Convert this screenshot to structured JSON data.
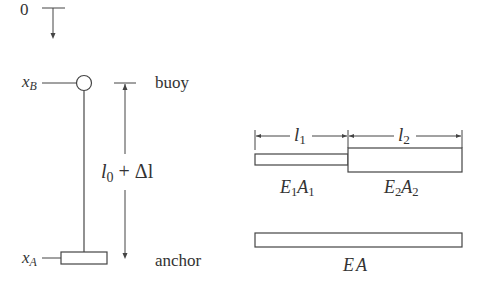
{
  "left_diagram": {
    "origin_label": "0",
    "buoy_position": {
      "var": "x",
      "sub": "B"
    },
    "anchor_position": {
      "var": "x",
      "sub": "A"
    },
    "length_label": {
      "var": "l",
      "sub": "0",
      "rest": " + Δl"
    },
    "buoy_label": "buoy",
    "anchor_label": "anchor"
  },
  "right_diagram": {
    "segment1_length": {
      "var": "l",
      "sub": "1"
    },
    "segment2_length": {
      "var": "l",
      "sub": "2"
    },
    "segment1_stiffness": {
      "e": "E",
      "esub": "1",
      "a": "A",
      "asub": "1"
    },
    "segment2_stiffness": {
      "e": "E",
      "esub": "2",
      "a": "A",
      "asub": "2"
    },
    "equivalent_stiffness": "EA"
  },
  "colors": {
    "stroke": "#444444",
    "text": "#333333"
  }
}
